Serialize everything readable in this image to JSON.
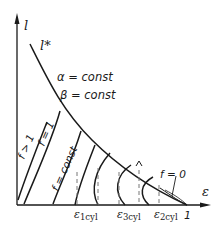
{
  "diagram": {
    "axes": {
      "y_label": "l",
      "x_label": "ε",
      "x_end_tick": "1"
    },
    "curve_label": "l*",
    "annotations": {
      "alpha": "α = const",
      "beta": "β = const",
      "f_gt_1": "f > 1",
      "f_eq_1": "f = 1",
      "f_const": "f = const",
      "f_zero": "f = 0"
    },
    "x_ticks": [
      {
        "main": "ε",
        "sub": "1cyl"
      },
      {
        "main": "ε",
        "sub": "3cyl"
      },
      {
        "main": "ε",
        "sub": "2cyl"
      }
    ],
    "colors": {
      "line": "#1a1a1a",
      "dashed": "#666666",
      "background": "#ffffff"
    }
  }
}
